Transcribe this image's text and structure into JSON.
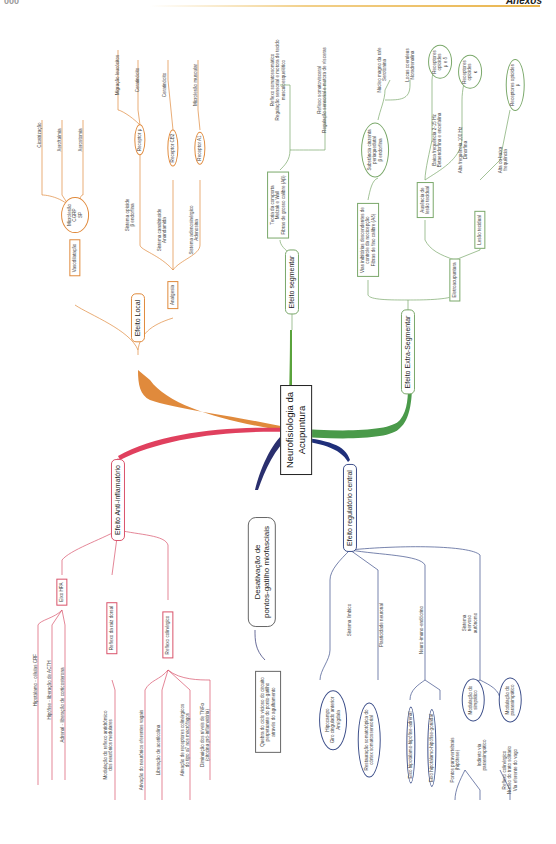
{
  "header": {
    "page_number": "000",
    "section": "Anexos"
  },
  "central_node": {
    "line1": "Neurofisiologia da",
    "line2": "Acupuntura"
  },
  "colors": {
    "local": "#e08a3c",
    "segmental": "#5aa33c",
    "extra_segmental": "#4a9a4a",
    "anti_inflammatory": "#e0405e",
    "trigger_points": "#2a2f6e",
    "central": "#1f2f7a"
  },
  "local": {
    "label": "Efeito Local",
    "vasodilation": {
      "label": "Vasodilatação",
      "microlesion": {
        "l1": "Microlesão",
        "l2": "CGRP",
        "l3": "SP"
      },
      "leaves": [
        "Cicatrização",
        "Xeroftalmia",
        "Xerostomia"
      ]
    },
    "analgesia": {
      "label": "Analgesia",
      "opioid": {
        "l1": "Sistema opioide",
        "l2": "β endorfina",
        "receptor": "Receptor μ",
        "leaves": [
          "Migração leucócitos",
          "Ceratinócito"
        ]
      },
      "cannabinoid": {
        "l1": "Sistema canabinoide",
        "l2": "Anandamida",
        "receptor": "Receptor CB2",
        "leaves": [
          "Ceratinócito"
        ]
      },
      "adenosinergic": {
        "l1": "Sistema adenosinérgico",
        "l2": "Adenosina",
        "receptor": "Receptor A1",
        "leaves": [
          "Microlesão muscular"
        ]
      }
    }
  },
  "segmental": {
    "label": "Efeito segmentar",
    "gate": {
      "l1": "Teoria da comporta",
      "l2": "Melzak e Wall",
      "l3": "Fibras de grosso calibre (Aβ)"
    },
    "somatosomatic": {
      "l1": "Reflexo somatossomático",
      "l2": "Regulação sensorial e motora de tecido",
      "l3": "musculoesquelético"
    },
    "somatovisceral": {
      "l1": "Reflexo somatovisceral",
      "l2": "Regulação sensorial e motora de vísceras"
    }
  },
  "extra_segmental": {
    "label": "Efeito Extra-Segmentar",
    "descending": {
      "l1": "Vias inibitórias descendentes de",
      "l2": "controle da nocicepção",
      "l3": "Fibras de fino calibre (Aδ)"
    },
    "pag": {
      "l1": "Substância cinzenta",
      "l2": "periaquedutal",
      "l3": "β endorfina"
    },
    "raphe": {
      "l1": "Núcleo magno da rafe",
      "l2": "Serotonina"
    },
    "locus": {
      "l1": "Locus coeruleus",
      "l2": "Noradrenalina"
    },
    "electro": {
      "label": "Eletroacupuntura"
    },
    "no_lesion": {
      "l1": "Ausência de",
      "l2": "lesão tecidual"
    },
    "low_freq": {
      "l1": "Baixa frequência 2-15 Hz",
      "l2": "Betaendorfina e encefalina"
    },
    "high_freq": {
      "l1": "Alta frequência 100 Hz",
      "l2": "Dinorfina"
    },
    "rec_mu_delta": {
      "l1": "Receptores",
      "l2": "opioides",
      "l3": "μ e δ"
    },
    "rec_kappa": {
      "l1": "Receptores",
      "l2": "opioides",
      "l3": "κ"
    },
    "lesion": {
      "label": "Lesão tecidual"
    },
    "high_low": {
      "l1": "Alta ou baixa",
      "l2": "frequência"
    },
    "rec_mu": {
      "l1": "Receptores opioides",
      "l2": "μ"
    }
  },
  "anti_inflammatory": {
    "label": "Efeito Anti-inflamatório",
    "hpa": {
      "label": "Eixo HPA",
      "leaves": [
        "Hipotálamo - células CRF",
        "Hipófise - liberação de ACTH",
        "Adrenal - liberação de corticosterona"
      ]
    },
    "dorsal_root": {
      "label": "Reflexo da raiz dorsal",
      "leaf_l1": "Modulação do reflexo antidrômico",
      "leaf_l2": "dos neurônios medulares"
    },
    "cholinergic": {
      "label": "Reflexo colinérgico",
      "leaves": [
        "Ativação do neurônios eferentes vagais",
        "Liberação de acetilcolina"
      ],
      "leaf3_l1": "Ativação de receptores colinérgicos",
      "leaf3_l2": "do tipo α7 nos macrófagos",
      "leaf4_l1": "Diminuição dos níveis de TNFα",
      "leaf4_l2": "(citocina pró-inflamatória)"
    }
  },
  "trigger_points": {
    "l1": "Desativação de",
    "l2": "pontos-gatilho miofasciais",
    "leaf_l1": "Quebra do ciclo vicioso do circuito",
    "leaf_l2": "perpetuante do ponto-gatilho",
    "leaf_l3": "através do agulhamento"
  },
  "central": {
    "label": "Efeito regulatório central",
    "limbic": {
      "label": "Sistema límbico",
      "l1": "Hipocampo",
      "l2": "Giro cingulado anterior",
      "l3": "Amígdala"
    },
    "plasticity": {
      "label": "Plasticidade neuronal",
      "l1": "Restauração somatotópica do",
      "l2": "córtex somatossensorial"
    },
    "neuro_immuno": {
      "label": "Neuro-imuno-endócrino",
      "axis1": "Eixo hipotálamo-hipófise-adrenal",
      "axis2": "Eixo hipotálamo-hipófise-gonadal"
    },
    "autonomic": {
      "l1": "Sistema",
      "l2": "nervoso",
      "l3": "autônomo",
      "sympathetic": {
        "l1": "Modulação do",
        "l2": "simpático",
        "leaf1_l1": "Pontos paravertebrais",
        "leaf1_l2": "(hipótese)",
        "leaf2_l1": "Indireto via",
        "leaf2_l2": "parassimpático"
      },
      "parasympathetic": {
        "l1": "Modulação do",
        "l2": "parassimpático",
        "leaf_l1": "Reflexo colinérgico",
        "leaf_l2": "Núcleo do trato solitário",
        "leaf_l3": "Via eferente do vago"
      }
    }
  }
}
